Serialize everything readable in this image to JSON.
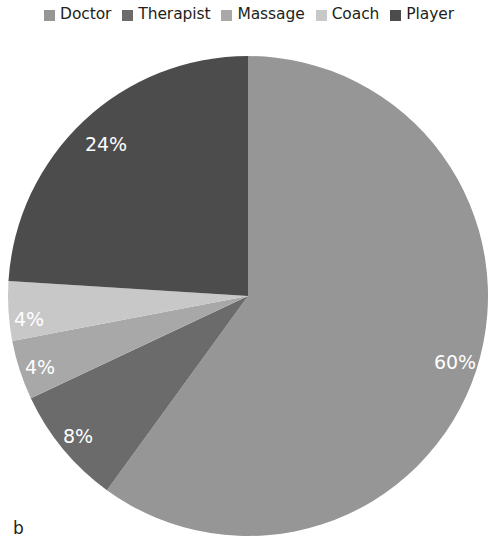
{
  "panel": {
    "label": "b"
  },
  "legend": {
    "position": "top",
    "items": [
      {
        "label": "Doctor",
        "color": "#969696",
        "swatch_icon": "square-swatch-icon"
      },
      {
        "label": "Therapist",
        "color": "#6b6b6b",
        "swatch_icon": "square-swatch-icon"
      },
      {
        "label": "Massage",
        "color": "#a8a8a8",
        "swatch_icon": "square-swatch-icon"
      },
      {
        "label": "Coach",
        "color": "#c8c8c8",
        "swatch_icon": "square-swatch-icon"
      },
      {
        "label": "Player",
        "color": "#4c4c4c",
        "swatch_icon": "square-swatch-icon"
      }
    ]
  },
  "chart_data": {
    "type": "pie",
    "title": "",
    "subtitle": "",
    "xlabel": "",
    "ylabel": "",
    "grid": false,
    "legend_position": "top",
    "start_angle_deg": 0,
    "direction": "clockwise",
    "units": "percent",
    "total": 100,
    "categories": [
      "Doctor",
      "Therapist",
      "Massage",
      "Coach",
      "Player"
    ],
    "values": [
      60,
      8,
      4,
      4,
      24
    ],
    "colors": [
      "#969696",
      "#6b6b6b",
      "#a8a8a8",
      "#c8c8c8",
      "#4c4c4c"
    ],
    "data_labels": [
      "60%",
      "8%",
      "4%",
      "4%",
      "24%"
    ],
    "data_label_color": "#ffffff",
    "slices": [
      {
        "name": "Doctor",
        "value": 60,
        "label": "60%",
        "color": "#969696"
      },
      {
        "name": "Therapist",
        "value": 8,
        "label": "8%",
        "color": "#6b6b6b"
      },
      {
        "name": "Massage",
        "value": 4,
        "label": "4%",
        "color": "#a8a8a8"
      },
      {
        "name": "Coach",
        "value": 4,
        "label": "4%",
        "color": "#c8c8c8"
      },
      {
        "name": "Player",
        "value": 24,
        "label": "24%",
        "color": "#4c4c4c"
      }
    ],
    "label_positions": [
      {
        "label": "60%",
        "x": 455,
        "y": 363
      },
      {
        "label": "8%",
        "x": 78,
        "y": 437
      },
      {
        "label": "4%",
        "x": 40,
        "y": 368
      },
      {
        "label": "4%",
        "x": 29,
        "y": 320
      },
      {
        "label": "24%",
        "x": 106,
        "y": 145
      }
    ],
    "geometry": {
      "cx": 248,
      "cy": 296,
      "r": 240
    }
  }
}
